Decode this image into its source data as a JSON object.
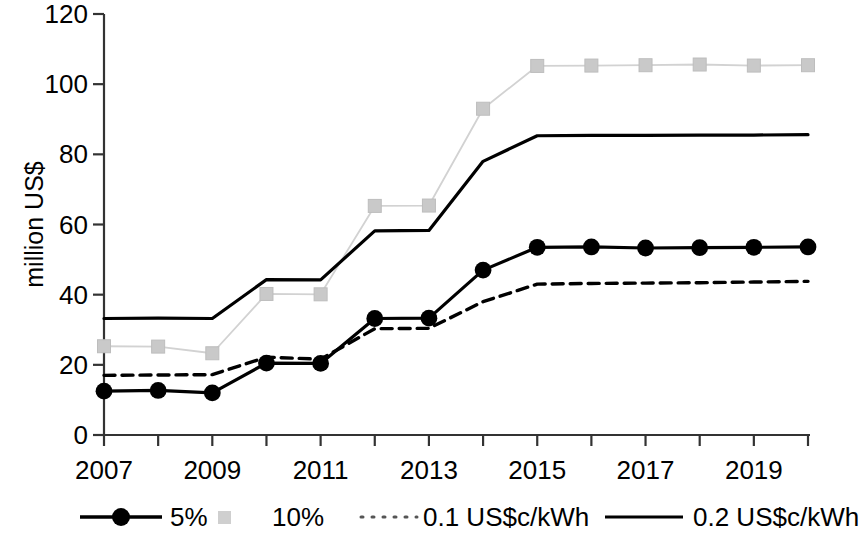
{
  "chart_data": {
    "type": "line",
    "title": "",
    "xlabel": "",
    "ylabel": "million US$",
    "x": [
      2007,
      2008,
      2009,
      2010,
      2011,
      2012,
      2013,
      2014,
      2015,
      2016,
      2017,
      2018,
      2019,
      2020
    ],
    "xlim": [
      2007,
      2020
    ],
    "ylim": [
      0,
      120
    ],
    "y_ticks": [
      0,
      20,
      40,
      60,
      80,
      100,
      120
    ],
    "x_ticks": [
      2007,
      2009,
      2011,
      2013,
      2015,
      2017,
      2019
    ],
    "x_tick_labels": [
      "2007",
      "2009",
      "2011",
      "2013",
      "2015",
      "2017",
      "2019"
    ],
    "y_tick_labels": [
      "0",
      "20",
      "40",
      "60",
      "80",
      "100",
      "120"
    ],
    "grid": false,
    "legend_position": "bottom",
    "series": [
      {
        "name": "5%",
        "color": "#000000",
        "style": "solid-marker",
        "marker": "circle",
        "values": [
          12.5,
          12.7,
          12.0,
          20.5,
          20.4,
          33.2,
          33.3,
          47.0,
          53.5,
          53.6,
          53.3,
          53.4,
          53.5,
          53.6
        ]
      },
      {
        "name": "10%",
        "color": "#c8c8c8",
        "style": "solid-marker",
        "marker": "square",
        "values": [
          25.3,
          25.2,
          23.3,
          40.2,
          40.1,
          65.3,
          65.4,
          93.0,
          105.2,
          105.3,
          105.4,
          105.6,
          105.3,
          105.4
        ]
      },
      {
        "name": "0.1 US$c/kWh",
        "color": "#000000",
        "style": "dashed",
        "marker": "none",
        "values": [
          17.0,
          17.1,
          17.2,
          22.2,
          21.6,
          30.3,
          30.4,
          38.0,
          43.0,
          43.2,
          43.3,
          43.4,
          43.6,
          43.8
        ]
      },
      {
        "name": "0.2 US$c/kWh",
        "color": "#000000",
        "style": "solid",
        "marker": "none",
        "values": [
          33.2,
          33.3,
          33.2,
          44.3,
          44.2,
          58.2,
          58.3,
          78.0,
          85.3,
          85.4,
          85.4,
          85.5,
          85.5,
          85.6
        ]
      }
    ]
  },
  "legend": {
    "items": [
      {
        "label": "5%",
        "swatch": "line-circle-marker"
      },
      {
        "label": "10%",
        "swatch": "square-marker"
      },
      {
        "label": "0.1 US$c/kWh",
        "swatch": "dotted-line"
      },
      {
        "label": "0.2 US$c/kWh",
        "swatch": "solid-line"
      }
    ]
  }
}
